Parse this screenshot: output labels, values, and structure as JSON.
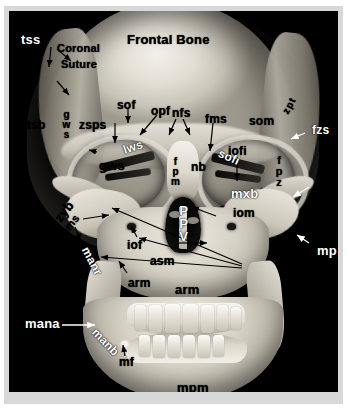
{
  "figure": {
    "type": "3d-ct-skull-reconstruction",
    "view": "anterior (frontal) view of human skull",
    "border_color": "#d8d8d8",
    "background_color": "#000000"
  },
  "labels": {
    "tss": "tss",
    "coronal_suture": "Coronal\nSuture",
    "coronal_suture_line1": "Coronal",
    "coronal_suture_line2": "Suture",
    "frontal_bone": "Frontal Bone",
    "tsb": "tsb",
    "gws_left": "gws",
    "zsps": "zsps",
    "sof": "sof",
    "opf": "opf",
    "nfs": "nfs",
    "fms": "fms",
    "som": "som",
    "zpt": "zpt",
    "fzs": "fzs",
    "lws": "lws",
    "gws": "gws",
    "nb": "nb",
    "fpm": "fpm",
    "sofi": "sofi",
    "iofi": "iofi",
    "fpz": "fpz",
    "za": "za",
    "mxb_upper": "mxb",
    "iom": "iom",
    "zyb": "zyb",
    "zmms": "zmms",
    "fp": "fp",
    "ppv": "PPV",
    "iof": "iof",
    "asm": "asm",
    "arm_left": "arm",
    "arm_center": "arm",
    "manr": "manr",
    "mxb_lower": "mxb",
    "mp": "mp",
    "mana": "mana",
    "manb": "manb",
    "mf": "mf",
    "mpm": "mpm"
  },
  "label_colors": {
    "black": "#000000",
    "white": "#ffffff"
  }
}
